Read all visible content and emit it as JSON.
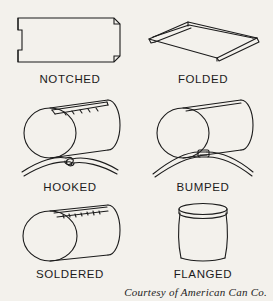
{
  "figure": {
    "title_visible": false,
    "background_color": "#f3f1ec",
    "ink_color": "#1b1b1b",
    "layout": "2 columns x 3 rows of labeled line drawings",
    "credit": "Courtesy of American Can Co.",
    "panels": [
      {
        "id": "notched",
        "label": "NOTCHED",
        "drawing": "flat-rectangular-sheet-with-notched-corners",
        "column": 1,
        "row": 1
      },
      {
        "id": "folded",
        "label": "FOLDED",
        "drawing": "flat-sheet-in-perspective-with-folded-edges",
        "column": 2,
        "row": 1
      },
      {
        "id": "hooked",
        "label": "HOOKED",
        "drawing": "cylinder-with-hooked-seam-plus-seam-cross-section",
        "column": 1,
        "row": 2
      },
      {
        "id": "bumped",
        "label": "BUMPED",
        "drawing": "cylinder-with-bumped-seam-plus-seam-cross-section",
        "column": 2,
        "row": 2
      },
      {
        "id": "soldered",
        "label": "SOLDERED",
        "drawing": "cylinder-with-soldered-seam",
        "column": 1,
        "row": 3
      },
      {
        "id": "flanged",
        "label": "FLANGED",
        "drawing": "upright-can-body-with-flanged-rim",
        "column": 2,
        "row": 3
      }
    ]
  }
}
